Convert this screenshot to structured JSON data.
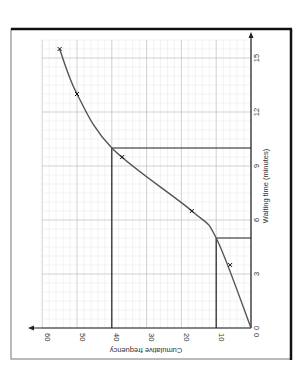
{
  "chart_data": {
    "type": "line",
    "title": "",
    "orientation": "rotated 90 degrees clockwise",
    "xlabel": "Waiting time (minutes)",
    "ylabel": "Cumulative frequency",
    "xlim": [
      0,
      16
    ],
    "ylim": [
      0,
      60
    ],
    "x_ticks": [
      "0",
      "3",
      "6",
      "9",
      "12",
      "15"
    ],
    "y_ticks": [
      "0",
      "10",
      "20",
      "30",
      "40",
      "50",
      "60"
    ],
    "grid": true,
    "series": [
      {
        "name": "Cumulative frequency curve",
        "points": [
          {
            "x": 3.5,
            "y": 6
          },
          {
            "x": 6.5,
            "y": 17
          },
          {
            "x": 9.5,
            "y": 37
          },
          {
            "x": 13,
            "y": 50
          },
          {
            "x": 15.5,
            "y": 55
          }
        ],
        "curve_start": {
          "x": 0,
          "y": 0
        }
      }
    ],
    "reference_lines": [
      {
        "cf": 10,
        "time": 5,
        "description": "lower reading at cumulative frequency 10"
      },
      {
        "cf": 40,
        "time": 10,
        "description": "upper reading at cumulative frequency 40"
      }
    ]
  },
  "labels": {
    "x_axis_title": "Waiting time (minutes)",
    "y_axis_title": "Cumulative frequency",
    "x_ticks": [
      "0",
      "3",
      "6",
      "9",
      "12",
      "15"
    ],
    "y_ticks": [
      "0",
      "10",
      "20",
      "30",
      "40",
      "50",
      "60"
    ]
  },
  "colors": {
    "grid_minor": "#e0e0e0",
    "grid_major": "#bdbdbd",
    "curve": "#555555",
    "axis": "#222222",
    "frame": "#111111"
  }
}
